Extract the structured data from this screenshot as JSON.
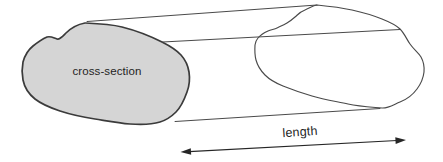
{
  "diagram": {
    "kind": "prism-with-uniform-cross-section",
    "labels": {
      "cross_section": "cross-section",
      "length": "length"
    },
    "colors": {
      "background": "#ffffff",
      "face_fill": "#d5d5d5",
      "face_outline": "#3b3b3b",
      "far_face_outline": "#4a4a4a",
      "edge_line": "#4a4a4a",
      "arrow": "#262626",
      "text": "#1f1f1f"
    }
  }
}
